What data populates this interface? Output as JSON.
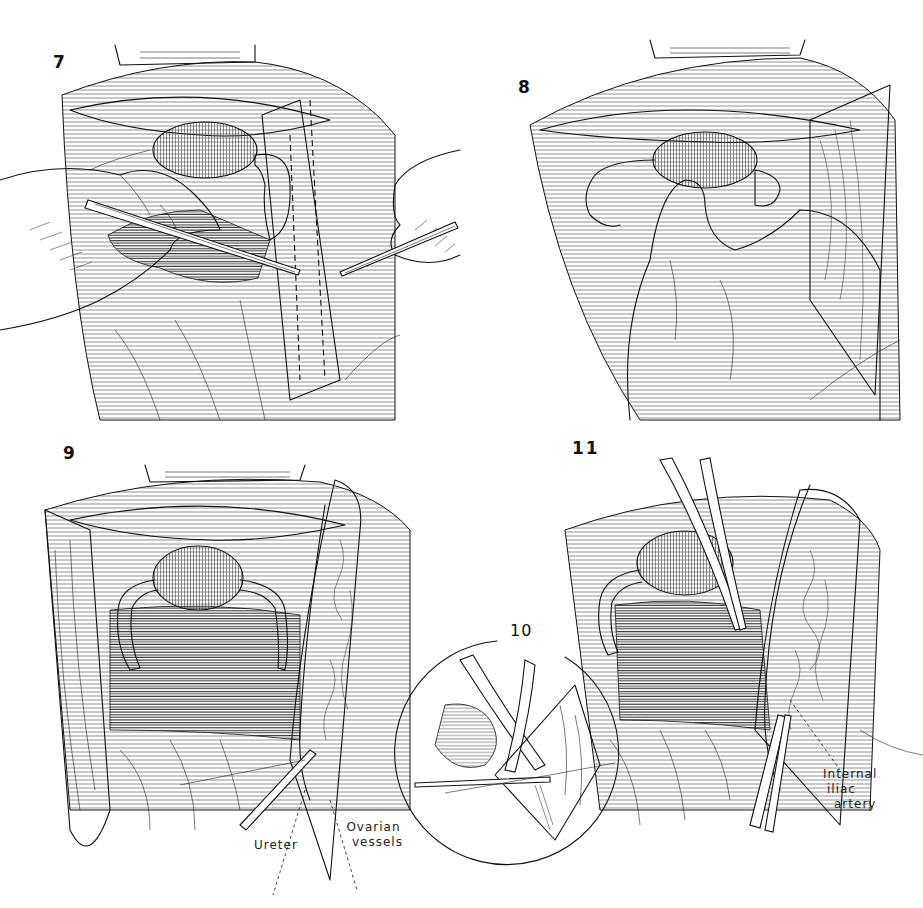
{
  "plate": {
    "background_color": "#ffffff",
    "ink_color": "#111111",
    "panels": [
      {
        "id": "7",
        "number_label": "7"
      },
      {
        "id": "8",
        "number_label": "8"
      },
      {
        "id": "9",
        "number_label": "9"
      },
      {
        "id": "10",
        "number_label": "10",
        "shape": "circle-inset"
      },
      {
        "id": "11",
        "number_label": "11"
      }
    ],
    "callouts": {
      "ureter": "Ureter",
      "ovarian_vessels_line1": "Ovarian",
      "ovarian_vessels_line2": "vessels",
      "internal_iliac_line1": "Internal",
      "internal_iliac_line2": "iliac",
      "internal_iliac_line3": "artery"
    }
  }
}
